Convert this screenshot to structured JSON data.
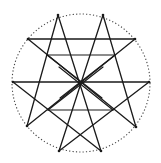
{
  "figure": {
    "type": "star-polygon-diagram",
    "circle": {
      "cx": 81,
      "cy": 83,
      "r": 69,
      "style": "dotted",
      "color": "#444444"
    },
    "line_color": "#1a1a1a",
    "vertices": [
      {
        "id": 0,
        "name": "top-left",
        "x": 58,
        "y": 15
      },
      {
        "id": 1,
        "name": "top-right",
        "x": 103,
        "y": 15
      },
      {
        "id": 2,
        "name": "right-upper",
        "x": 135,
        "y": 39
      },
      {
        "id": 3,
        "name": "right-middle",
        "x": 149,
        "y": 82
      },
      {
        "id": 4,
        "name": "right-lower",
        "x": 136,
        "y": 127
      },
      {
        "id": 5,
        "name": "bottom-right",
        "x": 101,
        "y": 151
      },
      {
        "id": 6,
        "name": "bottom-left",
        "x": 59,
        "y": 151
      },
      {
        "id": 7,
        "name": "left-lower",
        "x": 27,
        "y": 126
      },
      {
        "id": 8,
        "name": "left-middle",
        "x": 13,
        "y": 82
      },
      {
        "id": 9,
        "name": "left-upper",
        "x": 28,
        "y": 39
      }
    ],
    "chords": [
      [
        0,
        7
      ],
      [
        0,
        5
      ],
      [
        1,
        4
      ],
      [
        1,
        6
      ],
      [
        2,
        9
      ],
      [
        2,
        7
      ],
      [
        3,
        8
      ],
      [
        3,
        6
      ],
      [
        4,
        9
      ],
      [
        5,
        8
      ]
    ],
    "inner_segments": [
      {
        "x1": 47,
        "y1": 55,
        "x2": 115,
        "y2": 55
      },
      {
        "x1": 48,
        "y1": 110,
        "x2": 113,
        "y2": 110
      },
      {
        "x1": 47,
        "y1": 55,
        "x2": 102,
        "y2": 98
      },
      {
        "x1": 115,
        "y1": 55,
        "x2": 60,
        "y2": 98
      },
      {
        "x1": 48,
        "y1": 110,
        "x2": 103,
        "y2": 67
      },
      {
        "x1": 113,
        "y1": 110,
        "x2": 59,
        "y2": 67
      }
    ]
  }
}
